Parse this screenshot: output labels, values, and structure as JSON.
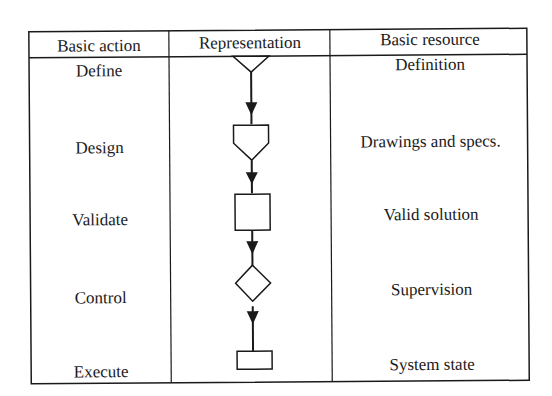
{
  "table": {
    "headers": [
      "Basic action",
      "Representation",
      "Basic resource"
    ],
    "rows": [
      {
        "action": "Define",
        "symbol": "inverted-triangle",
        "resource": "Definition"
      },
      {
        "action": "Design",
        "symbol": "pentagon-down",
        "resource": "Drawings and specs."
      },
      {
        "action": "Validate",
        "symbol": "square",
        "resource": "Valid solution"
      },
      {
        "action": "Control",
        "symbol": "diamond",
        "resource": "Supervision"
      },
      {
        "action": "Execute",
        "symbol": "flat-rectangle",
        "resource": "System state"
      }
    ]
  },
  "colors": {
    "line": "#1a1a1a",
    "background": "#ffffff"
  }
}
